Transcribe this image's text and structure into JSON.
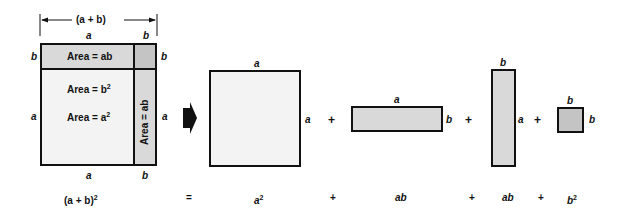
{
  "figure": {
    "colors": {
      "light_fill": "#f3f3f3",
      "mid_fill": "#d9d9d9",
      "dark_fill": "#c4c4c4",
      "stroke": "#111111"
    },
    "left_square": {
      "dimension_label": "(a + b)",
      "top_labels": [
        "a",
        "b"
      ],
      "left_labels": [
        "b",
        "a"
      ],
      "right_labels": [
        "b",
        "a"
      ],
      "bottom_labels": [
        "a",
        "b"
      ],
      "regions": {
        "top": "Area = ab",
        "corner": "Area = b",
        "corner_sup": "2",
        "main": "Area = a",
        "main_sup": "2",
        "right": "Area = ab"
      }
    },
    "arrow": "right-arrow",
    "pieces": [
      {
        "name": "a-squared",
        "top": "a",
        "side": "a"
      },
      {
        "name": "ab-horizontal",
        "top": "a",
        "side": "b"
      },
      {
        "name": "ab-vertical",
        "top": "b",
        "side": "a"
      },
      {
        "name": "b-squared",
        "top": "b",
        "side": "b"
      }
    ],
    "operators": [
      "+",
      "+",
      "+"
    ],
    "equation": {
      "lhs": "(a + b)",
      "lhs_sup": "2",
      "equals": "=",
      "terms": [
        "a",
        "ab",
        "ab",
        "b"
      ],
      "term_sups": [
        "2",
        "",
        "",
        "2"
      ],
      "plus": "+"
    }
  }
}
